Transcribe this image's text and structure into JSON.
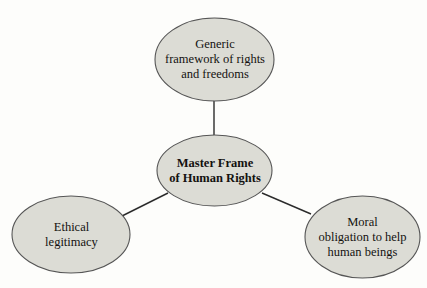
{
  "diagram": {
    "type": "hub-and-spoke concept map",
    "background_color": "#fdfdfb",
    "node_fill_color": "#dcdcd5",
    "node_stroke_color": "#555555",
    "connector_color": "#2b2b2b",
    "text_color": "#141210",
    "hub": {
      "id": "master-frame",
      "label": "Master Frame\nof Human Rights",
      "line1": "Master Frame",
      "line2": "of Human Rights"
    },
    "satellites": [
      {
        "id": "generic-framework",
        "position": "top",
        "label": "Generic\nframework of rights\nand freedoms",
        "line1": "Generic",
        "line2": "framework of rights",
        "line3": "and freedoms"
      },
      {
        "id": "ethical-legitimacy",
        "position": "bottom-left",
        "label": "Ethical\nlegitimacy",
        "line1": "Ethical",
        "line2": "legitimacy"
      },
      {
        "id": "moral-obligation",
        "position": "bottom-right",
        "label": "Moral\nobligation to help\nhuman beings",
        "line1": "Moral",
        "line2": "obligation to help",
        "line3": "human beings"
      }
    ],
    "connectors": [
      {
        "id": "hub-to-generic-framework",
        "from": "master-frame",
        "to": "generic-framework"
      },
      {
        "id": "hub-to-ethical-legitimacy",
        "from": "master-frame",
        "to": "ethical-legitimacy"
      },
      {
        "id": "hub-to-moral-obligation",
        "from": "master-frame",
        "to": "moral-obligation"
      }
    ]
  }
}
